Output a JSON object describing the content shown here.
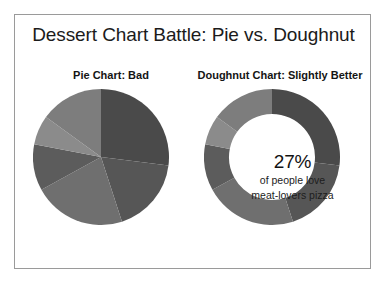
{
  "slide": {
    "title": "Dessert Chart Battle: Pie vs. Doughnut",
    "background_color": "#ffffff",
    "border_color": "#9a9a9a"
  },
  "panels": [
    {
      "id": "pie",
      "title": "Pie Chart: Bad"
    },
    {
      "id": "doughnut",
      "title": "Doughnut Chart: Slightly Better"
    }
  ],
  "doughnut_center": {
    "percent": "27%",
    "line2": "of people love",
    "line3": "meat-lovers pizza"
  },
  "chart_data": [
    {
      "type": "pie",
      "title": "Pie Chart: Bad",
      "center": [
        68,
        68
      ],
      "radius": 68,
      "start_angle_deg": 0,
      "direction": "clockwise",
      "grid": false,
      "legend": "none",
      "categories": [
        "Slice 1",
        "Slice 2",
        "Slice 3",
        "Slice 4",
        "Slice 5",
        "Slice 6"
      ],
      "values": [
        27,
        18,
        22,
        11,
        7,
        15
      ],
      "colors": [
        "#4a4a4a",
        "#565656",
        "#6f6f6f",
        "#5c5c5c",
        "#8b8b8b",
        "#7d7d7d"
      ],
      "xlabel": "",
      "ylabel": ""
    },
    {
      "type": "pie",
      "title": "Doughnut Chart: Slightly Better",
      "center": [
        68,
        68
      ],
      "radius": 68,
      "inner_radius": 43,
      "start_angle_deg": 0,
      "direction": "clockwise",
      "grid": false,
      "legend": "none",
      "center_text": [
        "27%",
        "of people love",
        "meat-lovers pizza"
      ],
      "categories": [
        "Slice 1",
        "Slice 2",
        "Slice 3",
        "Slice 4",
        "Slice 5",
        "Slice 6"
      ],
      "values": [
        27,
        18,
        22,
        11,
        7,
        15
      ],
      "colors": [
        "#4a4a4a",
        "#565656",
        "#6f6f6f",
        "#5c5c5c",
        "#8b8b8b",
        "#7d7d7d"
      ],
      "xlabel": "",
      "ylabel": ""
    }
  ]
}
